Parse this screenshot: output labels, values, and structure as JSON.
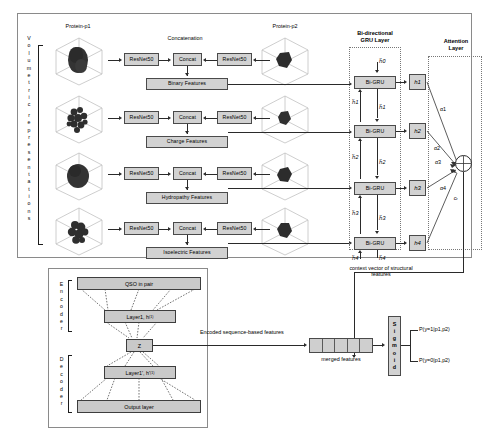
{
  "diagram": {
    "structural_branch": {
      "side_label": "Volumetric representations",
      "protein_left_label": "Protein-p1",
      "protein_right_label": "Protein-p2",
      "concatenation_label": "Concatenation",
      "encoder_name": "ResNet50",
      "concat_name": "Concat",
      "feature_rows": [
        {
          "feature_label": "Binary Features",
          "left_encoder": "ResNet50",
          "right_encoder": "ResNet50",
          "concat": "Concat"
        },
        {
          "feature_label": "Charge Features",
          "left_encoder": "ResNet50",
          "right_encoder": "ResNet50",
          "concat": "Concat"
        },
        {
          "feature_label": "Hydropathy Features",
          "left_encoder": "ResNet50",
          "right_encoder": "ResNet50",
          "concat": "Concat"
        },
        {
          "feature_label": "Isoelectric Features",
          "left_encoder": "ResNet50",
          "right_encoder": "ResNet50",
          "concat": "Concat"
        }
      ]
    },
    "gru_layer": {
      "title_line1": "Bi-directional",
      "title_line2": "GRU Layer",
      "cell_label": "Bi-GRU",
      "cells": [
        {
          "cell": "Bi-GRU",
          "forward_state": "h⃗0",
          "backward_state": "h⃖1",
          "output": "h1"
        },
        {
          "cell": "Bi-GRU",
          "forward_state": "h⃗1",
          "backward_state": "h⃖2",
          "output": "h2"
        },
        {
          "cell": "Bi-GRU",
          "forward_state": "h⃗2",
          "backward_state": "h⃖3",
          "output": "h3"
        },
        {
          "cell": "Bi-GRU",
          "forward_state": "h⃗3",
          "backward_state": "h⃖4",
          "output": "h4"
        }
      ],
      "final_forward_state": "h⃗4",
      "final_backward_state": "h⃖4",
      "context_caption_line1": "context vector of structural",
      "context_caption_line2": "features"
    },
    "attention_layer": {
      "title_line1": "Attention",
      "title_line2": "Layer",
      "hidden_outputs": [
        "h1",
        "h2",
        "h3",
        "h4"
      ],
      "weights": [
        "α1",
        "α2",
        "α3",
        "α4"
      ],
      "sum_symbol": "⊕",
      "context_vector": "cₜ"
    },
    "autoencoder": {
      "encoder_label": "Encoder",
      "decoder_label": "Decoder",
      "input_layer": "QSO in pair",
      "encoder_hidden": "Layer1, h",
      "encoder_hidden_sup": "(1)",
      "bottleneck": "Z",
      "decoder_hidden": "Layer1', h'",
      "decoder_hidden_sup": "(1)",
      "output_layer": "Output layer",
      "encoded_features_label": "Encoded sequence-based features"
    },
    "fusion": {
      "merged_features_label": "merged features",
      "merged_segment_count": 5,
      "sigmoid_label": "Sigmoid",
      "sigmoid_letters": [
        "S",
        "i",
        "g",
        "m",
        "o",
        "i",
        "d"
      ],
      "output_positive": "P(y=1|p1,p2)",
      "output_negative": "P(y=0|p1,p2)"
    },
    "colors": {
      "box_fill": "#d2d2d2",
      "box_border": "#4a4a4a",
      "panel_border": "#8a8a8a",
      "line": "#2a2a2a",
      "protein_blob": "#2f2f2f"
    }
  }
}
